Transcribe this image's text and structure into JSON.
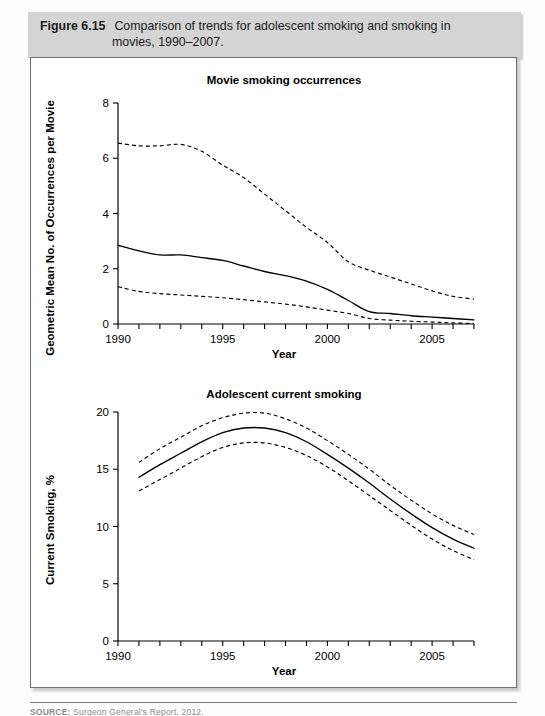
{
  "caption": {
    "label": "Figure 6.15",
    "line1": "Comparison of trends for adolescent smoking and smoking in",
    "line2": "movies, 1990–2007."
  },
  "source": {
    "label": "SOURCE:",
    "text": "Surgeon General's Report, 2012."
  },
  "colors": {
    "caption_bar": "#d4d4d4",
    "frame_border": "#6f6f6f",
    "ink": "#000000",
    "page": "#ffffff"
  },
  "chart_data": [
    {
      "id": "movie-smoking-occurrences",
      "type": "line",
      "title": "Movie smoking occurrences",
      "xlabel": "Year",
      "ylabel": "Geometric Mean No. of Occurrences per Movie",
      "xlim": [
        1990,
        2007
      ],
      "ylim": [
        0,
        8
      ],
      "xticks": [
        1990,
        1991,
        1992,
        1993,
        1994,
        1995,
        1996,
        1997,
        1998,
        1999,
        2000,
        2001,
        2002,
        2003,
        2004,
        2005,
        2006,
        2007
      ],
      "xtick_labels": [
        "1990",
        "",
        "",
        "",
        "",
        "1995",
        "",
        "",
        "",
        "",
        "2000",
        "",
        "",
        "",
        "",
        "2005",
        "",
        ""
      ],
      "yticks": [
        0,
        2,
        4,
        6,
        8
      ],
      "ytick_labels": [
        "0",
        "2",
        "4",
        "6",
        "8"
      ],
      "grid": false,
      "legend": "none",
      "x": [
        1990,
        1991,
        1992,
        1993,
        1994,
        1995,
        1996,
        1997,
        1998,
        1999,
        2000,
        2001,
        2002,
        2003,
        2004,
        2005,
        2006,
        2007
      ],
      "series": [
        {
          "name": "Upper 95% confidence limit",
          "style": "dashed",
          "values": [
            6.55,
            6.45,
            6.45,
            6.5,
            6.25,
            5.75,
            5.3,
            4.7,
            4.1,
            3.5,
            2.95,
            2.25,
            1.95,
            1.7,
            1.45,
            1.2,
            1.0,
            0.9
          ]
        },
        {
          "name": "Geometric mean",
          "style": "solid",
          "values": [
            2.85,
            2.65,
            2.5,
            2.5,
            2.4,
            2.3,
            2.1,
            1.9,
            1.75,
            1.55,
            1.25,
            0.85,
            0.45,
            0.38,
            0.3,
            0.25,
            0.2,
            0.15
          ]
        },
        {
          "name": "Lower 95% confidence limit",
          "style": "dashed",
          "values": [
            1.35,
            1.18,
            1.1,
            1.05,
            1.0,
            0.95,
            0.88,
            0.8,
            0.72,
            0.62,
            0.5,
            0.38,
            0.2,
            0.14,
            0.1,
            0.07,
            0.04,
            0.02
          ]
        }
      ]
    },
    {
      "id": "adolescent-current-smoking",
      "type": "line",
      "title": "Adolescent current smoking",
      "xlabel": "Year",
      "ylabel": "Current Smoking, %",
      "xlim": [
        1990,
        2007
      ],
      "ylim": [
        0,
        20
      ],
      "xticks": [
        1990,
        1991,
        1992,
        1993,
        1994,
        1995,
        1996,
        1997,
        1998,
        1999,
        2000,
        2001,
        2002,
        2003,
        2004,
        2005,
        2006,
        2007
      ],
      "xtick_labels": [
        "1990",
        "",
        "",
        "",
        "",
        "1995",
        "",
        "",
        "",
        "",
        "2000",
        "",
        "",
        "",
        "",
        "2005",
        "",
        ""
      ],
      "yticks": [
        0,
        5,
        10,
        15,
        20
      ],
      "ytick_labels": [
        "0",
        "5",
        "10",
        "15",
        "20"
      ],
      "grid": false,
      "legend": "none",
      "x": [
        1991,
        1992,
        1993,
        1994,
        1995,
        1996,
        1997,
        1998,
        1999,
        2000,
        2001,
        2002,
        2003,
        2004,
        2005,
        2006,
        2007
      ],
      "series": [
        {
          "name": "Upper 95% confidence limit",
          "style": "dashed",
          "values": [
            15.6,
            16.8,
            17.8,
            18.8,
            19.5,
            19.9,
            19.9,
            19.4,
            18.6,
            17.5,
            16.3,
            15.0,
            13.6,
            12.3,
            11.1,
            10.1,
            9.3
          ]
        },
        {
          "name": "Prevalence estimate",
          "style": "solid",
          "values": [
            14.3,
            15.4,
            16.4,
            17.4,
            18.2,
            18.6,
            18.6,
            18.2,
            17.4,
            16.3,
            15.1,
            13.8,
            12.4,
            11.1,
            9.9,
            8.9,
            8.1
          ]
        },
        {
          "name": "Lower 95% confidence limit",
          "style": "dashed",
          "values": [
            13.1,
            14.1,
            15.1,
            16.1,
            16.9,
            17.3,
            17.3,
            16.9,
            16.2,
            15.2,
            14.0,
            12.7,
            11.4,
            10.1,
            8.9,
            7.9,
            7.1
          ]
        }
      ]
    }
  ]
}
